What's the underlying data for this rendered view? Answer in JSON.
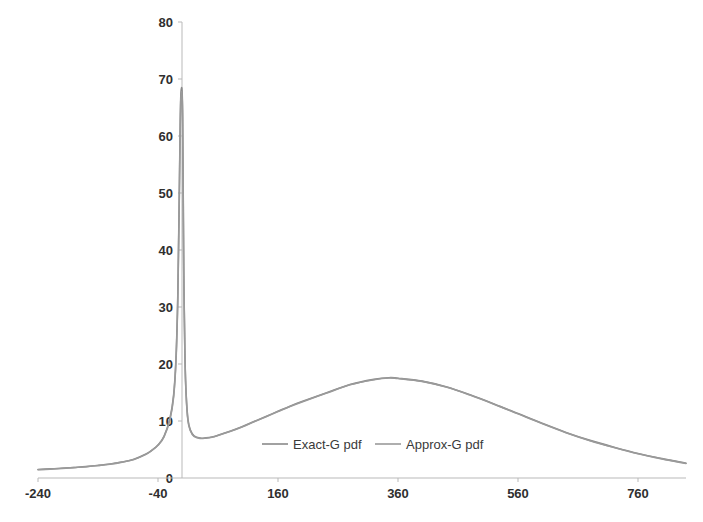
{
  "chart_data": {
    "type": "line",
    "title": "",
    "xlabel": "",
    "ylabel": "",
    "xlim": [
      -240,
      840
    ],
    "ylim": [
      0,
      80
    ],
    "grid": false,
    "legend_position": "inside-bottom-center",
    "xticks": [
      -240,
      -40,
      160,
      360,
      560,
      760
    ],
    "xtick_labels": [
      "-240",
      "-40",
      "160",
      "360",
      "560",
      "760"
    ],
    "yticks": [
      0,
      10,
      20,
      30,
      40,
      50,
      60,
      70,
      80
    ],
    "ytick_labels": [
      "0",
      "10",
      "20",
      "30",
      "40",
      "50",
      "60",
      "70",
      "80"
    ],
    "series": [
      {
        "name": "Exact-G pdf",
        "color": "#8a8a8a",
        "x": [
          -240,
          -220,
          -200,
          -180,
          -160,
          -140,
          -120,
          -100,
          -80,
          -60,
          -50,
          -40,
          -30,
          -20,
          -14,
          -10,
          -7,
          -5,
          -3,
          -2,
          -1,
          0,
          1,
          2,
          3,
          5,
          7,
          10,
          14,
          20,
          30,
          40,
          50,
          60,
          80,
          100,
          120,
          140,
          160,
          180,
          200,
          240,
          280,
          320,
          345,
          360,
          400,
          440,
          480,
          520,
          560,
          600,
          640,
          680,
          720,
          760,
          800,
          840
        ],
        "y": [
          1.5,
          1.6,
          1.7,
          1.85,
          2.0,
          2.2,
          2.45,
          2.8,
          3.3,
          4.2,
          4.9,
          5.8,
          7.3,
          10.5,
          14.5,
          21.0,
          32.0,
          46.0,
          62.0,
          67.0,
          68.3,
          68.0,
          64.0,
          50.0,
          36.0,
          21.0,
          14.5,
          10.2,
          8.4,
          7.4,
          7.0,
          7.05,
          7.2,
          7.5,
          8.2,
          9.0,
          9.9,
          10.8,
          11.7,
          12.6,
          13.4,
          14.9,
          16.4,
          17.3,
          17.6,
          17.5,
          17.0,
          16.0,
          14.6,
          13.0,
          11.3,
          9.6,
          8.0,
          6.6,
          5.4,
          4.3,
          3.4,
          2.6
        ]
      },
      {
        "name": "Approx-G pdf",
        "color": "#9a9a9a",
        "x": [
          -240,
          -220,
          -200,
          -180,
          -160,
          -140,
          -120,
          -100,
          -80,
          -60,
          -50,
          -40,
          -30,
          -20,
          -14,
          -10,
          -7,
          -5,
          -3,
          -2,
          -1,
          0,
          1,
          2,
          3,
          5,
          7,
          10,
          14,
          20,
          30,
          40,
          50,
          60,
          80,
          100,
          120,
          140,
          160,
          180,
          200,
          240,
          280,
          320,
          345,
          360,
          400,
          440,
          480,
          520,
          560,
          600,
          640,
          680,
          720,
          760,
          800,
          840
        ],
        "y": [
          1.45,
          1.55,
          1.68,
          1.82,
          1.98,
          2.18,
          2.42,
          2.78,
          3.26,
          4.15,
          4.85,
          5.75,
          7.2,
          10.3,
          14.2,
          20.6,
          31.4,
          45.2,
          61.2,
          66.3,
          67.6,
          67.3,
          63.3,
          49.4,
          35.5,
          20.7,
          14.3,
          10.0,
          8.3,
          7.3,
          6.95,
          7.0,
          7.15,
          7.45,
          8.15,
          8.95,
          9.85,
          10.75,
          11.65,
          12.55,
          13.35,
          14.85,
          16.35,
          17.25,
          17.55,
          17.45,
          16.95,
          15.95,
          14.55,
          12.95,
          11.25,
          9.55,
          7.95,
          6.55,
          5.35,
          4.25,
          3.35,
          2.55
        ]
      }
    ]
  },
  "legend": {
    "items": [
      {
        "label": "Exact-G pdf",
        "color": "#8a8a8a"
      },
      {
        "label": "Approx-G pdf",
        "color": "#9a9a9a"
      }
    ]
  },
  "colors": {
    "axis": "#b9b9b9",
    "tick_text": "#2f2f2f",
    "background": "#ffffff"
  }
}
